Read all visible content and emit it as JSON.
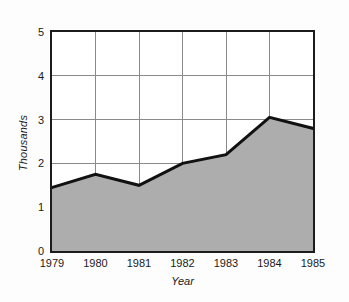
{
  "chart_data": {
    "type": "area",
    "title": "",
    "xlabel": "Year",
    "ylabel": "Thousands",
    "categories": [
      "1979",
      "1980",
      "1981",
      "1982",
      "1983",
      "1984",
      "1985"
    ],
    "x": [
      1979,
      1980,
      1981,
      1982,
      1983,
      1984,
      1985
    ],
    "values": [
      1.45,
      1.75,
      1.5,
      2.0,
      2.2,
      3.05,
      2.8
    ],
    "series": [
      {
        "name": "Thousands",
        "values": [
          1.45,
          1.75,
          1.5,
          2.0,
          2.2,
          3.05,
          2.8
        ]
      }
    ],
    "xlim": [
      1979,
      1985
    ],
    "ylim": [
      0,
      5
    ],
    "y_ticks": [
      0,
      1,
      2,
      3,
      4,
      5
    ],
    "y_tick_labels": [
      "0",
      "1",
      "2",
      "3",
      "4",
      "5"
    ],
    "x_ticks": [
      1979,
      1980,
      1981,
      1982,
      1983,
      1984,
      1985
    ],
    "x_tick_labels": [
      "1979",
      "1980",
      "1981",
      "1982",
      "1983",
      "1984",
      "1985"
    ],
    "grid": true,
    "grid_axes": "both",
    "legend": false,
    "legend_position": "none",
    "colors": {
      "fill": "#adadad",
      "line": "#111111",
      "grid": "#8a8a8a",
      "frame": "#1c1c1c",
      "background": "#ffffff",
      "page_background": "#fdfdfd",
      "text": "#1a1a1a"
    },
    "annotations": []
  }
}
